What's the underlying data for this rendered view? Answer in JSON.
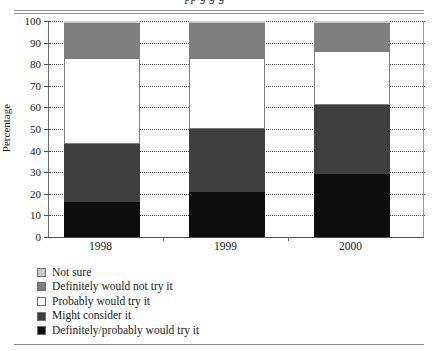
{
  "header": {
    "clipped_title": "pp  g        g g"
  },
  "axes": {
    "ylabel": "Percentage",
    "yticks": [
      0,
      10,
      20,
      30,
      40,
      50,
      60,
      70,
      80,
      90,
      100
    ],
    "xlabels": [
      "1998",
      "1999",
      "2000"
    ]
  },
  "legend": {
    "items": [
      {
        "label": "Not sure",
        "color": "#c9c9c9"
      },
      {
        "label": "Definitely would not try it",
        "color": "#7f7f7f"
      },
      {
        "label": "Probably would try it",
        "color": "#ffffff"
      },
      {
        "label": "Might consider it",
        "color": "#3f3f3f"
      },
      {
        "label": "Definitely/probably would try it",
        "color": "#0d0d0d"
      }
    ]
  },
  "chart_data": {
    "type": "bar",
    "subtype": "stacked-bar-percent",
    "title": "",
    "xlabel": "",
    "ylabel": "Percentage",
    "ylim": [
      0,
      100
    ],
    "ytick_step": 10,
    "grid": true,
    "legend_position": "below-left",
    "categories": [
      "1998",
      "1999",
      "2000"
    ],
    "series": [
      {
        "name": "Definitely/probably would try it",
        "color": "#0d0d0d",
        "values": [
          16,
          21,
          29
        ]
      },
      {
        "name": "Might consider it",
        "color": "#3f3f3f",
        "values": [
          27,
          29,
          32
        ]
      },
      {
        "name": "Probably would try it",
        "color": "#ffffff",
        "values": [
          40,
          33,
          25
        ]
      },
      {
        "name": "Definitely would not try it",
        "color": "#7f7f7f",
        "values": [
          16,
          16,
          13
        ]
      },
      {
        "name": "Not sure",
        "color": "#c9c9c9",
        "values": [
          1,
          1,
          1
        ]
      }
    ],
    "cumulative_tops": {
      "1998": [
        16,
        43,
        83,
        99,
        100
      ],
      "1999": [
        21,
        50,
        83,
        99,
        100
      ],
      "2000": [
        29,
        61,
        86,
        99,
        100
      ]
    }
  }
}
